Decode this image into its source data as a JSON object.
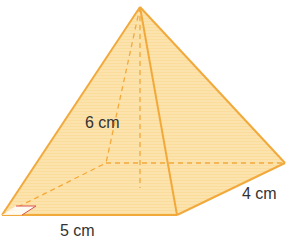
{
  "diagram": {
    "type": "square-based pyramid (rectangular base)",
    "labels": {
      "height": "6 cm",
      "base_length": "5 cm",
      "base_width": "4 cm"
    },
    "colors": {
      "fill": "#FCE3AE",
      "edge": "#F2A93B",
      "right_angle": "#D9534F",
      "text": "#333333"
    }
  }
}
